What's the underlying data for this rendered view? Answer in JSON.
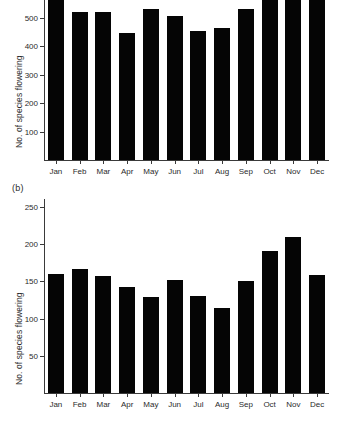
{
  "figure": {
    "background": "#ffffff",
    "bar_color": "#050505",
    "axis_color": "#3a3a3a",
    "text_color": "#2b2b2b"
  },
  "panels": [
    {
      "tag": "",
      "ylabel": "No. of species flowering"
    },
    {
      "tag": "(b)",
      "ylabel": "No. of species flowering"
    }
  ],
  "chart_data": [
    {
      "type": "bar",
      "panel": "a",
      "title": "",
      "xlabel": "",
      "ylabel": "No. of species flowering",
      "categories": [
        "Jan",
        "Feb",
        "Mar",
        "Apr",
        "May",
        "Jun",
        "Jul",
        "Aug",
        "Sep",
        "Oct",
        "Nov",
        "Dec"
      ],
      "values": [
        545,
        452,
        451,
        377,
        463,
        438,
        384,
        394,
        460,
        557,
        600,
        550
      ],
      "yticks": [
        100,
        200,
        300,
        400,
        500
      ],
      "ytick_labels": [
        "100",
        "200",
        "300",
        "400",
        "500"
      ],
      "ylim": [
        0,
        600
      ],
      "grid": false,
      "legend": "none",
      "note": "Nov bar extends past the top edge of the cropped image; 600 tick label is clipped"
    },
    {
      "type": "bar",
      "panel": "b",
      "title": "",
      "xlabel": "",
      "ylabel": "No. of species flowering",
      "categories": [
        "Jan",
        "Feb",
        "Mar",
        "Apr",
        "May",
        "Jun",
        "Jul",
        "Aug",
        "Sep",
        "Oct",
        "Nov",
        "Dec"
      ],
      "values": [
        160,
        167,
        157,
        143,
        129,
        152,
        131,
        114,
        151,
        191,
        210,
        158
      ],
      "yticks": [
        50,
        100,
        150,
        200,
        250
      ],
      "ytick_labels": [
        "50",
        "100",
        "150",
        "200",
        "250"
      ],
      "ylim": [
        0,
        250
      ],
      "grid": false,
      "legend": "none"
    }
  ]
}
